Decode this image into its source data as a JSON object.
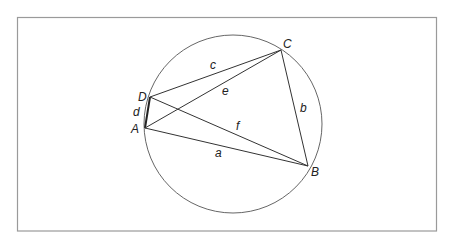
{
  "diagram": {
    "frame": {
      "x": 17,
      "y": 17,
      "width": 419,
      "height": 214,
      "stroke": "#999999"
    },
    "circle": {
      "cx": 233,
      "cy": 124,
      "r": 89,
      "stroke": "#444444"
    },
    "points": {
      "A": {
        "x": 145,
        "y": 128,
        "label": "A"
      },
      "B": {
        "x": 308,
        "y": 166,
        "label": "B"
      },
      "C": {
        "x": 281,
        "y": 50,
        "label": "C"
      },
      "D": {
        "x": 150,
        "y": 97,
        "label": "D"
      }
    },
    "segments": {
      "a": {
        "label": "a",
        "from": "A",
        "to": "B"
      },
      "b": {
        "label": "b",
        "from": "B",
        "to": "C"
      },
      "c": {
        "label": "c",
        "from": "C",
        "to": "D"
      },
      "d": {
        "label": "d",
        "from": "D",
        "to": "A"
      },
      "e": {
        "label": "e",
        "from": "A",
        "to": "C"
      },
      "f": {
        "label": "f",
        "from": "D",
        "to": "B"
      }
    },
    "line_color": "#333333"
  }
}
